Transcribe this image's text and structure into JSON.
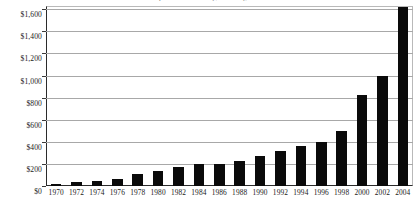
{
  "chart_data": {
    "type": "bar",
    "title": "U.S. Imports from China ($ billions), 1970-2004",
    "xlabel": "",
    "ylabel": "",
    "categories": [
      "1970",
      "1972",
      "1974",
      "1976",
      "1978",
      "1980",
      "1982",
      "1984",
      "1986",
      "1988",
      "1990",
      "1992",
      "1994",
      "1996",
      "1998",
      "2000",
      "2002",
      "2004"
    ],
    "values": [
      15,
      35,
      45,
      65,
      110,
      140,
      170,
      195,
      200,
      230,
      270,
      320,
      365,
      400,
      500,
      820,
      1000,
      1620
    ],
    "y_ticks": [
      "$0",
      "$200",
      "$400",
      "$600",
      "$800",
      "$1,000",
      "$1,200",
      "$1,400",
      "$1,600"
    ],
    "y_tick_values": [
      0,
      200,
      400,
      600,
      800,
      1000,
      1200,
      1400,
      1600
    ],
    "ylim": [
      0,
      1630
    ],
    "grid": true,
    "legend": "none",
    "bar_color": "#0a0a0a",
    "gridline_color": "#a8a8a8",
    "axis_color": "#2b2b2b"
  }
}
